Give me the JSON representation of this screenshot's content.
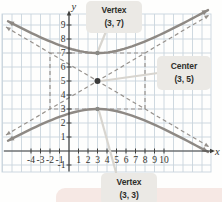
{
  "figure": {
    "background": "#fefefd",
    "page_strip_color": "#f6e8e4"
  },
  "chart_data": {
    "type": "line",
    "center": {
      "x": 3,
      "y": 5
    },
    "a": 2,
    "b": 5,
    "vertices": [
      {
        "x": 3,
        "y": 7
      },
      {
        "x": 3,
        "y": 3
      }
    ],
    "fundamental_rectangle": {
      "x_min": -2,
      "x_max": 8,
      "y_min": 3,
      "y_max": 7
    },
    "asymptote_slopes": [
      0.4,
      -0.4
    ],
    "x_axis": {
      "label": "x",
      "ticks": [
        -4,
        -3,
        -2,
        -1,
        1,
        2,
        3,
        4,
        5,
        6,
        7,
        8,
        9,
        10
      ],
      "range": [
        -7,
        15
      ]
    },
    "y_axis": {
      "label": "y",
      "ticks": [
        -1,
        1,
        2,
        3,
        4,
        5,
        6,
        7,
        8,
        9
      ],
      "range": [
        -2,
        10
      ]
    },
    "grid": true,
    "colors": {
      "curve": "#8e8984",
      "dashed": "#97928d",
      "grid": "#c9d5dd",
      "axis": "#3f3f3d",
      "tick_text": "#33332f",
      "point_dark": "#3b3b3b",
      "point_gray": "#8a8a86",
      "pointer": "#d8d5cf"
    }
  },
  "annotations": {
    "vertex_top": {
      "title": "Vertex",
      "coords": "(3, 7)"
    },
    "center": {
      "title": "Center",
      "coords": "(3, 5)"
    },
    "vertex_bottom": {
      "title": "Vertex",
      "coords": "(3, 3)"
    }
  }
}
